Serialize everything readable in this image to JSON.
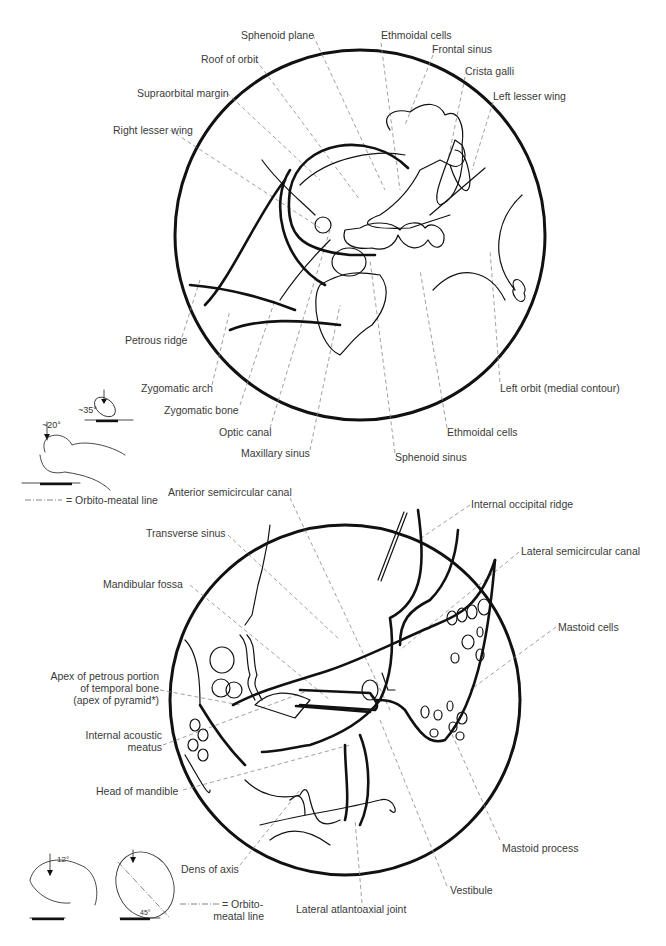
{
  "top_view": {
    "labels": [
      {
        "id": "sphenoid-plane",
        "text": "Sphenoid plane",
        "x": 241,
        "y": 29
      },
      {
        "id": "ethmoidal-cells-top",
        "text": "Ethmoidal cells",
        "x": 381,
        "y": 29
      },
      {
        "id": "frontal-sinus",
        "text": "Frontal sinus",
        "x": 432,
        "y": 43
      },
      {
        "id": "roof-of-orbit",
        "text": "Roof of orbit",
        "x": 201,
        "y": 53
      },
      {
        "id": "crista-galli",
        "text": "Crista galli",
        "x": 465,
        "y": 65
      },
      {
        "id": "supraorbital-margin",
        "text": "Supraorbital margin",
        "x": 137,
        "y": 87
      },
      {
        "id": "left-lesser-wing",
        "text": "Left lesser wing",
        "x": 493,
        "y": 90
      },
      {
        "id": "right-lesser-wing",
        "text": "Right lesser wing",
        "x": 113,
        "y": 124
      },
      {
        "id": "petrous-ridge",
        "text": "Petrous ridge",
        "x": 125,
        "y": 334
      },
      {
        "id": "zygomatic-arch",
        "text": "Zygomatic arch",
        "x": 141,
        "y": 382
      },
      {
        "id": "left-orbit-medial",
        "text": "Left orbit (medial contour)",
        "x": 500,
        "y": 382
      },
      {
        "id": "zygomatic-bone",
        "text": "Zygomatic bone",
        "x": 164,
        "y": 404
      },
      {
        "id": "optic-canal",
        "text": "Optic canal",
        "x": 219,
        "y": 426
      },
      {
        "id": "ethmoidal-cells-bottom",
        "text": "Ethmoidal cells",
        "x": 447,
        "y": 426
      },
      {
        "id": "maxillary-sinus",
        "text": "Maxillary sinus",
        "x": 241,
        "y": 447
      },
      {
        "id": "sphenoid-sinus",
        "text": "Sphenoid sinus",
        "x": 395,
        "y": 451
      }
    ],
    "positioning": {
      "angle_1": "~20°",
      "angle_2": "~35°",
      "legend": "= Orbito-meatal line"
    }
  },
  "bottom_view": {
    "labels": [
      {
        "id": "anterior-semicircular-canal",
        "text": "Anterior semicircular canal",
        "x": 168,
        "y": 486
      },
      {
        "id": "internal-occipital-ridge",
        "text": "Internal occipital ridge",
        "x": 471,
        "y": 498
      },
      {
        "id": "transverse-sinus",
        "text": "Transverse sinus",
        "x": 146,
        "y": 527
      },
      {
        "id": "lateral-semicircular-canal",
        "text": "Lateral semicircular canal",
        "x": 521,
        "y": 545
      },
      {
        "id": "mandibular-fossa",
        "text": "Mandibular fossa",
        "x": 103,
        "y": 578
      },
      {
        "id": "mastoid-cells",
        "text": "Mastoid cells",
        "x": 558,
        "y": 621
      },
      {
        "id": "apex-petrous",
        "text": "Apex of petrous portion\nof temporal bone\n(apex of pyramid*)",
        "x": 43,
        "y": 670
      },
      {
        "id": "internal-acoustic-meatus",
        "text": "Internal acoustic\nmeatus",
        "x": 85,
        "y": 729
      },
      {
        "id": "head-of-mandible",
        "text": "Head of mandible",
        "x": 96,
        "y": 785
      },
      {
        "id": "mastoid-process",
        "text": "Mastoid process",
        "x": 502,
        "y": 842
      },
      {
        "id": "dens-of-axis",
        "text": "Dens of axis",
        "x": 181,
        "y": 863
      },
      {
        "id": "vestibule",
        "text": "Vestibule",
        "x": 450,
        "y": 884
      },
      {
        "id": "lateral-atlantoaxial-joint",
        "text": "Lateral atlantoaxial joint",
        "x": 296,
        "y": 903
      }
    ],
    "positioning": {
      "angle_1": "12°",
      "angle_2": "45°",
      "legend_line1": "= Orbito-",
      "legend_line2": "meatal line"
    }
  },
  "colors": {
    "ink": "#111111",
    "label_text": "#3a3a3a",
    "leader": "#777777"
  }
}
